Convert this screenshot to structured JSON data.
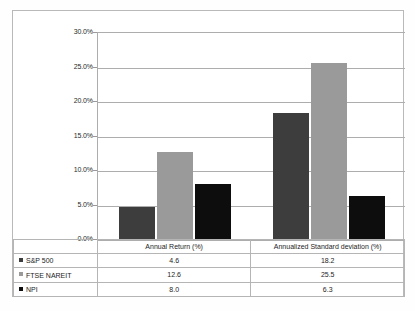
{
  "chart_data": {
    "type": "bar",
    "title": "",
    "subtitle": "",
    "xlabel": "",
    "ylabel": "",
    "ylim": [
      0,
      30
    ],
    "ytick_labels": [
      "30.0%",
      "25.0%",
      "20.0%",
      "15.0%",
      "10.0%",
      "5.0%",
      "0.0%"
    ],
    "ytick_values": [
      30,
      25,
      20,
      15,
      10,
      5,
      0
    ],
    "grid": true,
    "legend_position": "table-left",
    "categories": [
      "Annual Return (%)",
      "Annualized Standard deviation (%)"
    ],
    "series": [
      {
        "name": "S&P 500",
        "values": [
          4.6,
          18.2
        ],
        "color": "#3d3d3d"
      },
      {
        "name": "FTSE NAREIT",
        "values": [
          12.6,
          25.5
        ],
        "color": "#9a9a9a"
      },
      {
        "name": "NPI",
        "values": [
          8.0,
          6.3
        ],
        "color": "#0d0d0d"
      }
    ],
    "value_labels": {
      "S&P 500": [
        "4.6",
        "18.2"
      ],
      "FTSE NAREIT": [
        "12.6",
        "25.5"
      ],
      "NPI": [
        "8.0",
        "6.3"
      ]
    }
  },
  "table": {
    "header_blank": "",
    "columns": [
      "Annual Return (%)",
      "Annualized Standard deviation (%)"
    ],
    "rows": [
      {
        "label": "S&P 500",
        "swatch": "#3d3d3d",
        "cells": [
          "4.6",
          "18.2"
        ]
      },
      {
        "label": "FTSE NAREIT",
        "swatch": "#9a9a9a",
        "cells": [
          "12.6",
          "25.5"
        ]
      },
      {
        "label": "NPI",
        "swatch": "#0d0d0d",
        "cells": [
          "8.0",
          "6.3"
        ]
      }
    ]
  },
  "colors": {
    "sp500": "#3d3d3d",
    "ftse_nareit": "#9a9a9a",
    "npi": "#0d0d0d",
    "gridline": "#adadad",
    "border": "#b9b9b9",
    "table_border": "#b5b5b5",
    "background": "#ffffff"
  }
}
